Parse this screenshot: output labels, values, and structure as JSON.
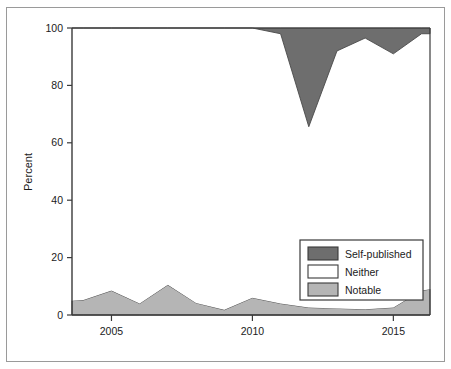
{
  "chart_data": {
    "type": "area",
    "title": "",
    "subtitle": "",
    "xlabel": "",
    "ylabel": "Percent",
    "stacked": true,
    "grid": false,
    "xlim": [
      2003.6,
      2016.3
    ],
    "ylim": [
      0,
      100
    ],
    "xticks": [
      2005,
      2010,
      2015
    ],
    "xtick_labels": [
      "2005",
      "2010",
      "2015"
    ],
    "yticks": [
      0,
      20,
      40,
      60,
      80,
      100
    ],
    "ytick_labels": [
      "0",
      "20",
      "40",
      "60",
      "80",
      "100"
    ],
    "x": [
      2003.6,
      2004,
      2005,
      2006,
      2007,
      2008,
      2009,
      2010,
      2011,
      2012,
      2013,
      2014,
      2015,
      2016,
      2016.3
    ],
    "legend_position": "lower-right",
    "series": [
      {
        "name": "Notable",
        "color": "#b5b5b5",
        "values": [
          5.0,
          5.2,
          8.5,
          4.0,
          10.5,
          4.2,
          1.8,
          6.0,
          4.0,
          2.6,
          2.3,
          2.0,
          2.6,
          8.5,
          9.0
        ]
      },
      {
        "name": "Neither",
        "color": "#ffffff",
        "values": [
          95.0,
          94.8,
          91.5,
          96.0,
          89.5,
          95.8,
          98.2,
          94.0,
          94.0,
          63.0,
          89.7,
          94.5,
          88.4,
          89.5,
          89.0
        ]
      },
      {
        "name": "Self-published",
        "color": "#6e6e6e",
        "values": [
          0,
          0,
          0,
          0,
          0,
          0,
          0,
          0,
          2.0,
          34.4,
          8.0,
          3.5,
          9.0,
          2.0,
          2.0
        ]
      }
    ]
  },
  "legend": {
    "items": [
      {
        "label": "Self-published",
        "swatch": "#6e6e6e"
      },
      {
        "label": "Neither",
        "swatch": "#ffffff"
      },
      {
        "label": "Notable",
        "swatch": "#b5b5b5"
      }
    ]
  },
  "axes": {
    "y_title": "Percent"
  },
  "colors": {
    "self_published": "#6e6e6e",
    "neither": "#ffffff",
    "notable": "#b5b5b5",
    "axis": "#3a3a3a",
    "frame": "#9a9a9a",
    "text": "#1b1b1b"
  }
}
